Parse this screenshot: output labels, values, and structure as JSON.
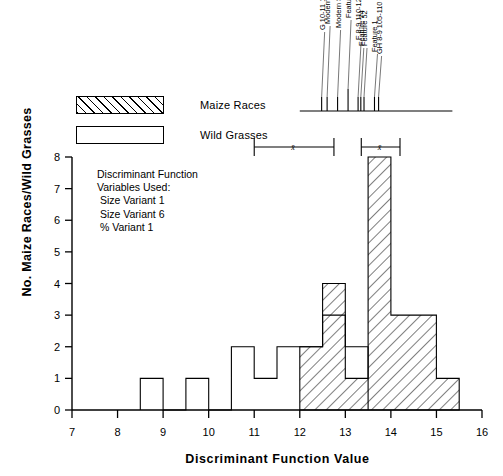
{
  "figure": {
    "xlabel": "Discriminant Function Value",
    "ylabel": "No. Maize Races/Wild Grasses"
  },
  "legend": {
    "items": [
      {
        "label": "Maize Races",
        "pattern": "hatched",
        "color": "#000000"
      },
      {
        "label": "Wild Grasses",
        "pattern": "open",
        "color": "#000000"
      }
    ]
  },
  "annotation": {
    "lines": [
      "Discriminant Function",
      "Variables Used:",
      " Size Variant 1",
      " Size Variant 6",
      " % Variant 1"
    ]
  },
  "sample_markers": {
    "axis_start": 12.0,
    "axis_end": 15.35,
    "labels": [
      {
        "text": "G 10-11 130-140",
        "value": 12.48
      },
      {
        "text": "Modern Soil Sample 2",
        "value": 12.6
      },
      {
        "text": "Modern Soil Sample",
        "value": 12.83
      },
      {
        "text": "Feature 62",
        "value": 13.06
      },
      {
        "text": "F 8-9 110-120",
        "value": 13.28
      },
      {
        "text": "Feature 74",
        "value": 13.34
      },
      {
        "text": "Feature 52",
        "value": 13.41
      },
      {
        "text": "Feature 1",
        "value": 13.64
      },
      {
        "text": "GH 8-9 105-110",
        "value": 13.73
      }
    ]
  },
  "range_bars": [
    {
      "name": "wild-grasses-range",
      "min": 11.0,
      "max": 12.75,
      "mean": 11.85,
      "mean_symbol": "x̄"
    },
    {
      "name": "maize-races-range",
      "min": 13.35,
      "max": 14.2,
      "mean": 13.75,
      "mean_symbol": "x̄"
    }
  ],
  "chart_data": {
    "type": "bar",
    "title": "",
    "xlabel": "Discriminant Function Value",
    "ylabel": "No. Maize Races/Wild Grasses",
    "xlim": [
      7,
      16
    ],
    "ylim": [
      0,
      8
    ],
    "xticks": [
      7,
      8,
      9,
      10,
      11,
      12,
      13,
      14,
      15,
      16
    ],
    "yticks": [
      0,
      1,
      2,
      3,
      4,
      5,
      6,
      7,
      8
    ],
    "grid": false,
    "legend_position": "upper-left",
    "bin_width": 0.5,
    "series": [
      {
        "name": "Wild Grasses",
        "style": "open",
        "bins": [
          {
            "x0": 8.5,
            "x1": 9.0,
            "value": 1
          },
          {
            "x0": 9.5,
            "x1": 10.0,
            "value": 1
          },
          {
            "x0": 10.5,
            "x1": 11.0,
            "value": 2
          },
          {
            "x0": 11.0,
            "x1": 11.5,
            "value": 1
          },
          {
            "x0": 11.5,
            "x1": 12.0,
            "value": 2
          },
          {
            "x0": 12.0,
            "x1": 12.5,
            "value": 2
          },
          {
            "x0": 12.5,
            "x1": 13.0,
            "value": 3
          },
          {
            "x0": 13.0,
            "x1": 13.5,
            "value": 2
          }
        ]
      },
      {
        "name": "Maize Races",
        "style": "hatched",
        "bins": [
          {
            "x0": 12.0,
            "x1": 12.5,
            "value": 2
          },
          {
            "x0": 12.5,
            "x1": 13.0,
            "value": 4
          },
          {
            "x0": 13.0,
            "x1": 13.5,
            "value": 1
          },
          {
            "x0": 13.5,
            "x1": 14.0,
            "value": 8
          },
          {
            "x0": 14.0,
            "x1": 14.5,
            "value": 3
          },
          {
            "x0": 14.5,
            "x1": 15.0,
            "value": 3
          },
          {
            "x0": 15.0,
            "x1": 15.5,
            "value": 1
          }
        ]
      }
    ]
  }
}
